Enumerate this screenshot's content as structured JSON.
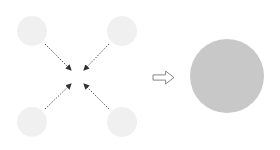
{
  "diagram": {
    "small_particles": [
      {
        "id": "top-left",
        "cx": 32,
        "cy": 31,
        "r": 15
      },
      {
        "id": "top-right",
        "cx": 122,
        "cy": 31,
        "r": 15
      },
      {
        "id": "bottom-left",
        "cx": 32,
        "cy": 122,
        "r": 15
      },
      {
        "id": "bottom-right",
        "cx": 122,
        "cy": 122,
        "r": 15
      }
    ],
    "converging_arrows": [
      {
        "id": "from-top-left",
        "x1": 45,
        "y1": 44,
        "x2": 71,
        "y2": 70
      },
      {
        "id": "from-top-right",
        "x1": 109,
        "y1": 44,
        "x2": 84,
        "y2": 70
      },
      {
        "id": "from-bottom-left",
        "x1": 45,
        "y1": 109,
        "x2": 71,
        "y2": 84
      },
      {
        "id": "from-bottom-right",
        "x1": 109,
        "y1": 109,
        "x2": 84,
        "y2": 84
      }
    ],
    "transition_arrow": {
      "x": 153,
      "y": 71,
      "width": 21,
      "height": 13
    },
    "large_particle": {
      "cx": 227,
      "cy": 76,
      "r": 37
    },
    "colors": {
      "small_particle_fill": "#f0f0f0",
      "large_particle_fill": "#c8c8c8",
      "arrow_stroke": "#555555",
      "transition_arrow_stroke": "#888888"
    }
  }
}
